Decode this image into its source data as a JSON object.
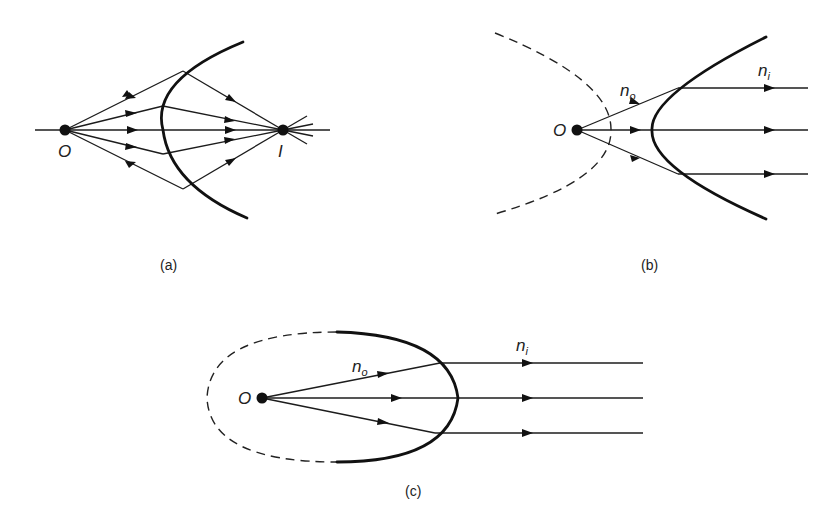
{
  "figure": {
    "panels": [
      {
        "id": "a",
        "caption": "(a)",
        "object_label": "O",
        "image_label": "I",
        "description": "Point source O; rays refract through a curved surface and converge at image point I"
      },
      {
        "id": "b",
        "caption": "(b)",
        "object_label": "O",
        "n_outside": "n",
        "n_outside_sub": "o",
        "n_inside": "n",
        "n_inside_sub": "i",
        "description": "Hyperbolic refracting surface collimating rays from O; dashed conjugate branch shown"
      },
      {
        "id": "c",
        "caption": "(c)",
        "object_label": "O",
        "n_outside": "n",
        "n_outside_sub": "o",
        "n_inside": "n",
        "n_inside_sub": "i",
        "description": "Ellipsoidal refracting surface collimating rays from O; dashed remainder of ellipse shown"
      }
    ]
  },
  "colors": {
    "ink": "#111111",
    "background": "#ffffff"
  }
}
